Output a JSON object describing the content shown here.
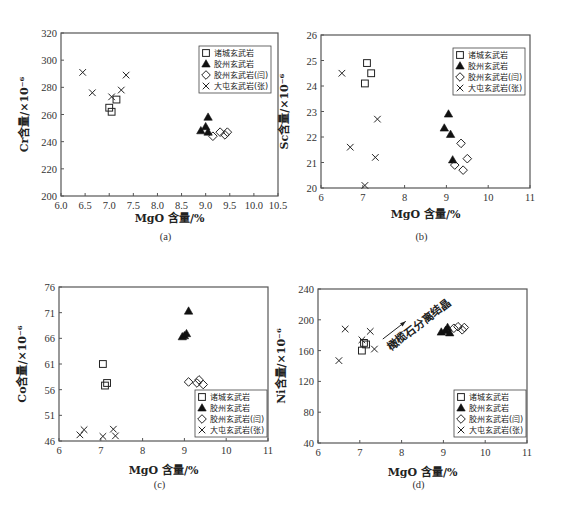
{
  "legend_entries": [
    {
      "key": "zhucheng",
      "label": "诸城玄武岩",
      "marker": "open-square"
    },
    {
      "key": "jiaozhou",
      "label": "胶州玄武岩",
      "marker": "filled-triangle"
    },
    {
      "key": "jiaozhou_yan",
      "label": "胶州玄武岩(闫)",
      "marker": "open-diamond"
    },
    {
      "key": "datun_zhang",
      "label": "大屯玄武岩(张)",
      "marker": "x-cross"
    }
  ],
  "chart_data": [
    {
      "id": "a",
      "type": "scatter",
      "panel_label": "(a)",
      "xlabel": "MgO 含量/%",
      "ylabel": "Cr含量/×10⁻⁶",
      "xlim": [
        6.0,
        10.5
      ],
      "ylim": [
        200,
        320
      ],
      "xticks": [
        6.0,
        6.5,
        7.0,
        7.5,
        8.0,
        8.5,
        9.0,
        9.5,
        10.0,
        10.5
      ],
      "xtick_labels": [
        "6.0",
        "6.5",
        "7.0",
        "7.5",
        "8.0",
        "8.5",
        "9.0",
        "9.5",
        "10.0",
        "10.5"
      ],
      "yticks": [
        200,
        220,
        240,
        260,
        280,
        300,
        320
      ],
      "ytick_labels": [
        "200",
        "220",
        "240",
        "260",
        "280",
        "300",
        "320"
      ],
      "legend_position": "top-right",
      "annotation": null,
      "series": [
        {
          "name": "诸城玄武岩",
          "points": [
            [
              7.0,
              265
            ],
            [
              7.05,
              262
            ],
            [
              7.15,
              271
            ]
          ]
        },
        {
          "name": "胶州玄武岩",
          "points": [
            [
              8.9,
              248
            ],
            [
              9.0,
              251
            ],
            [
              9.05,
              258
            ],
            [
              9.05,
              247
            ]
          ]
        },
        {
          "name": "胶州玄武岩(闫)",
          "points": [
            [
              9.15,
              244
            ],
            [
              9.3,
              247
            ],
            [
              9.4,
              245
            ],
            [
              9.45,
              247
            ]
          ]
        },
        {
          "name": "大屯玄武岩(张)",
          "points": [
            [
              6.45,
              291
            ],
            [
              6.65,
              276
            ],
            [
              7.05,
              273
            ],
            [
              7.25,
              278
            ],
            [
              7.35,
              289
            ]
          ]
        }
      ]
    },
    {
      "id": "b",
      "type": "scatter",
      "panel_label": "(b)",
      "xlabel": "MgO 含量/%",
      "ylabel": "Sc含量/×10⁻⁶",
      "xlim": [
        6,
        11
      ],
      "ylim": [
        20,
        26
      ],
      "xticks": [
        6,
        7,
        8,
        9,
        10,
        11
      ],
      "xtick_labels": [
        "6",
        "7",
        "8",
        "9",
        "10",
        "11"
      ],
      "yticks": [
        20,
        21,
        22,
        23,
        24,
        25,
        26
      ],
      "ytick_labels": [
        "20",
        "21",
        "22",
        "23",
        "24",
        "25",
        "26"
      ],
      "legend_position": "top-right",
      "annotation": null,
      "series": [
        {
          "name": "诸城玄武岩",
          "points": [
            [
              7.1,
              24.9
            ],
            [
              7.2,
              24.5
            ],
            [
              7.05,
              24.1
            ]
          ]
        },
        {
          "name": "胶州玄武岩",
          "points": [
            [
              8.95,
              22.35
            ],
            [
              9.05,
              22.9
            ],
            [
              9.1,
              22.1
            ],
            [
              9.15,
              21.1
            ]
          ]
        },
        {
          "name": "胶州玄武岩(闫)",
          "points": [
            [
              9.2,
              20.9
            ],
            [
              9.35,
              21.75
            ],
            [
              9.4,
              20.7
            ],
            [
              9.5,
              21.15
            ]
          ]
        },
        {
          "name": "大屯玄武岩(张)",
          "points": [
            [
              6.5,
              24.5
            ],
            [
              6.7,
              21.6
            ],
            [
              7.05,
              20.1
            ],
            [
              7.3,
              21.2
            ],
            [
              7.35,
              22.7
            ]
          ]
        }
      ]
    },
    {
      "id": "c",
      "type": "scatter",
      "panel_label": "(c)",
      "xlabel": "MgO 含量/%",
      "ylabel": "Co含量/×10⁻⁶",
      "xlim": [
        6,
        11
      ],
      "ylim": [
        46,
        76
      ],
      "xticks": [
        6,
        7,
        8,
        9,
        10,
        11
      ],
      "xtick_labels": [
        "6",
        "7",
        "8",
        "9",
        "10",
        "11"
      ],
      "yticks": [
        46,
        51,
        56,
        61,
        66,
        71,
        76
      ],
      "ytick_labels": [
        "46",
        "51",
        "56",
        "61",
        "66",
        "71",
        "76"
      ],
      "legend_position": "bottom-right",
      "annotation": null,
      "series": [
        {
          "name": "诸城玄武岩",
          "points": [
            [
              7.05,
              61
            ],
            [
              7.1,
              56.8
            ],
            [
              7.15,
              57.3
            ]
          ]
        },
        {
          "name": "胶州玄武岩",
          "points": [
            [
              8.95,
              66.3
            ],
            [
              9.0,
              66.5
            ],
            [
              9.05,
              66.9
            ],
            [
              9.1,
              71.3
            ]
          ]
        },
        {
          "name": "胶州玄武岩(闫)",
          "points": [
            [
              9.1,
              57.5
            ],
            [
              9.3,
              57.3
            ],
            [
              9.35,
              57.9
            ],
            [
              9.45,
              57.0
            ]
          ]
        },
        {
          "name": "大屯玄武岩(张)",
          "points": [
            [
              6.5,
              47.2
            ],
            [
              6.6,
              48.2
            ],
            [
              7.05,
              46.9
            ],
            [
              7.3,
              48.3
            ],
            [
              7.35,
              47.0
            ]
          ]
        }
      ]
    },
    {
      "id": "d",
      "type": "scatter",
      "panel_label": "(d)",
      "xlabel": "MgO 含量/%",
      "ylabel": "Ni含量/×10⁻⁶",
      "xlim": [
        6,
        11
      ],
      "ylim": [
        40,
        240
      ],
      "xticks": [
        6,
        7,
        8,
        9,
        10,
        11
      ],
      "xtick_labels": [
        "6",
        "7",
        "8",
        "9",
        "10",
        "11"
      ],
      "yticks": [
        40,
        80,
        120,
        160,
        200,
        240
      ],
      "ytick_labels": [
        "40",
        "80",
        "120",
        "160",
        "200",
        "240"
      ],
      "legend_position": "bottom-right",
      "annotation": {
        "text": "橄榄石分离结晶",
        "arrow_from": [
          7.55,
          175
        ],
        "arrow_to": [
          8.1,
          198
        ]
      },
      "series": [
        {
          "name": "诸城玄武岩",
          "points": [
            [
              7.05,
              160
            ],
            [
              7.1,
              170
            ],
            [
              7.15,
              168
            ]
          ]
        },
        {
          "name": "胶州玄武岩",
          "points": [
            [
              8.95,
              184
            ],
            [
              9.05,
              186
            ],
            [
              9.1,
              190
            ],
            [
              9.15,
              183
            ]
          ]
        },
        {
          "name": "胶州玄武岩(闫)",
          "points": [
            [
              9.25,
              189
            ],
            [
              9.35,
              191
            ],
            [
              9.45,
              187
            ],
            [
              9.5,
              190
            ]
          ]
        },
        {
          "name": "大屯玄武岩(张)",
          "points": [
            [
              6.5,
              147
            ],
            [
              6.65,
              188
            ],
            [
              7.05,
              174
            ],
            [
              7.25,
              185
            ],
            [
              7.35,
              162
            ]
          ]
        }
      ]
    }
  ]
}
